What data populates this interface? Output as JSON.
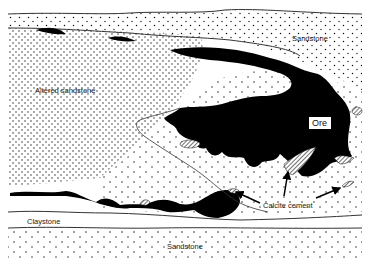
{
  "figure": {
    "type": "geological cross-section"
  },
  "colors": {
    "ore": "#000000",
    "background": "#ffffff",
    "lines": "#222222",
    "stipple": "#111111"
  },
  "labels": {
    "sandstone_top": "Sandstone",
    "altered_sandstone": "Altered sandstone",
    "ore": "Ore",
    "calcite_cement": "Calcite cement",
    "claystone": "Claystone",
    "sandstone_bottom": "Sandstone"
  },
  "legend_patterns": {
    "ore": "solid black",
    "calcite_cement": "diagonal hatching",
    "sandstone": "stipple dots"
  }
}
